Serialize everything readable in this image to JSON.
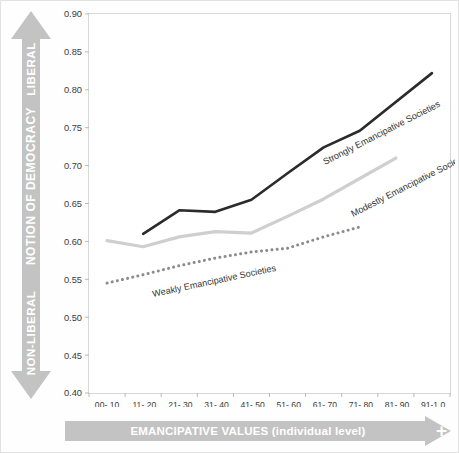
{
  "axes": {
    "vertical_arrow": {
      "top_label": "LIBERAL",
      "mid_label": "NOTION OF DEMOCRACY",
      "bottom_label": "NON-LIBERAL",
      "color": "#bfbfbf"
    },
    "horizontal_arrow": {
      "label": "EMANCIPATIVE VALUES (individual level)",
      "plus_sign": "+",
      "color": "#bfbfbf"
    }
  },
  "chart_data": {
    "type": "line",
    "title": "",
    "xlabel": "EMANCIPATIVE VALUES (individual level)",
    "ylabel": "NOTION OF DEMOCRACY",
    "grid": false,
    "legend": "inline-labels",
    "ylim": [
      0.4,
      0.9
    ],
    "ytick_labels": [
      "0.90",
      "0.85",
      "0.80",
      "0.75",
      "0.70",
      "0.65",
      "0.60",
      "0.55",
      "0.50",
      "0.45",
      "0.40"
    ],
    "ytick_values": [
      0.9,
      0.85,
      0.8,
      0.75,
      0.7,
      0.65,
      0.6,
      0.55,
      0.5,
      0.45,
      0.4
    ],
    "categories": [
      "00-.10",
      ".11-.20",
      ".21-.30",
      ".31-.40",
      ".41-.50",
      ".51-.60",
      ".61-.70",
      ".71-.80",
      ".81-.90",
      ".91-1.0"
    ],
    "series": [
      {
        "name": "Strongly Emancipative Societies",
        "style": "solid",
        "color": "#2b2b2b",
        "width": 2.6,
        "x": [
          ".11-.20",
          ".21-.30",
          ".31-.40",
          ".41-.50",
          ".51-.60",
          ".61-.70",
          ".71-.80",
          ".91-1.0"
        ],
        "x_index": [
          1,
          2,
          3,
          4,
          5,
          6,
          7,
          9
        ],
        "values": [
          0.61,
          0.641,
          0.639,
          0.655,
          0.69,
          0.724,
          0.746,
          0.822
        ]
      },
      {
        "name": "Modestly Emancipative Societies",
        "style": "solid",
        "color": "#cfcfcf",
        "width": 3.2,
        "x": [
          "00-.10",
          ".11-.20",
          ".21-.30",
          ".31-.40",
          ".41-.50",
          ".51-.60",
          ".61-.70",
          ".71-.80",
          ".81-.90"
        ],
        "x_index": [
          0,
          1,
          2,
          3,
          4,
          5,
          6,
          7,
          8
        ],
        "values": [
          0.601,
          0.593,
          0.606,
          0.613,
          0.611,
          0.633,
          0.656,
          0.683,
          0.71
        ]
      },
      {
        "name": "Weakly Emancipative Societies",
        "style": "dotted",
        "color": "#8c8c8c",
        "width": 3.0,
        "x": [
          "00-.10",
          ".11-.20",
          ".21-.30",
          ".31-.40",
          ".41-.50",
          ".51-.60",
          ".61-.70",
          ".71-.80"
        ],
        "x_index": [
          0,
          1,
          2,
          3,
          4,
          5,
          6,
          7
        ],
        "values": [
          0.545,
          0.556,
          0.568,
          0.578,
          0.586,
          0.591,
          0.606,
          0.619
        ]
      }
    ],
    "annotations": [
      {
        "text": "Strongly Emancipative Societies",
        "x_px": 268,
        "y_px": 160,
        "rotation": -27
      },
      {
        "text": "Modestly Emancipative Societies",
        "x_px": 296,
        "y_px": 212,
        "rotation": -27
      },
      {
        "text": "Weakly Emancipative Societies",
        "x_px": 96,
        "y_px": 292,
        "rotation": -12
      }
    ]
  }
}
